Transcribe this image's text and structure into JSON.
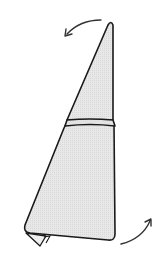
{
  "diagram": {
    "colors": {
      "background": "#ffffff",
      "fabric_fill": "#e6e6e6",
      "outline": "#1a1a1a",
      "arrow": "#333333"
    },
    "shapes": [
      {
        "name": "top-triangle-panel"
      },
      {
        "name": "horizontal-fold-band"
      },
      {
        "name": "lower-trapezoid-panel"
      },
      {
        "name": "folded-bottom-corner"
      }
    ],
    "arrows": [
      {
        "name": "top-arrow",
        "direction": "counter-clockwise, pointing left-down"
      },
      {
        "name": "bottom-arrow",
        "direction": "curving up, pointing right-up"
      }
    ]
  }
}
